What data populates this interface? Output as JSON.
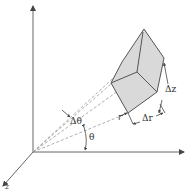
{
  "diagram": {
    "type": "cylindrical volume element",
    "labels": {
      "delta_theta": "Δθ",
      "theta": "θ",
      "r": "r",
      "delta_r": "Δr",
      "delta_z": "Δz",
      "z_axis": "z"
    },
    "colors": {
      "axis": "#555555",
      "box_fill": "#d9d9d9",
      "box_edge": "#555555",
      "dashed": "#888888",
      "background": "#ffffff"
    }
  }
}
